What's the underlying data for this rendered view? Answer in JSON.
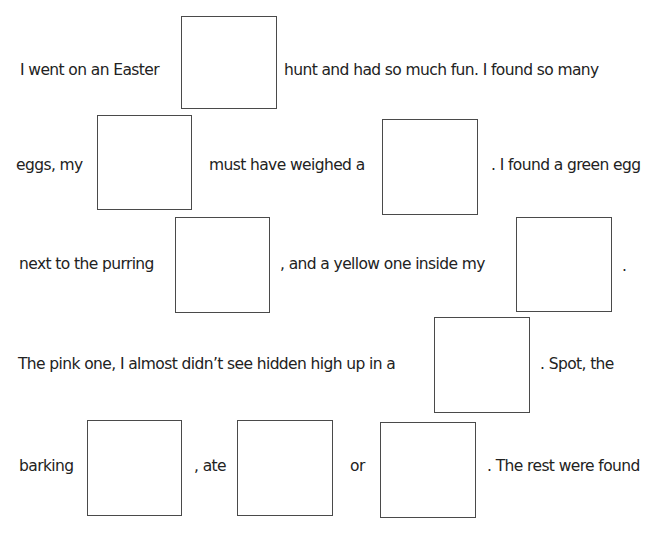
{
  "worksheet": {
    "lines": [
      {
        "segments": [
          {
            "text": "I went on an Easter",
            "x": 20,
            "y": 70
          },
          {
            "text": "hunt and had so much fun. I found so many",
            "x": 284,
            "y": 70
          }
        ],
        "blanks": [
          {
            "x": 181,
            "y": 16,
            "w": 96,
            "h": 93
          }
        ]
      },
      {
        "segments": [
          {
            "text": "eggs, my",
            "x": 16,
            "y": 165
          },
          {
            "text": "must have weighed a",
            "x": 209,
            "y": 165
          },
          {
            "text": ". I found a green egg",
            "x": 491,
            "y": 165
          }
        ],
        "blanks": [
          {
            "x": 97,
            "y": 115,
            "w": 95,
            "h": 95
          },
          {
            "x": 382,
            "y": 119,
            "w": 96,
            "h": 96
          }
        ]
      },
      {
        "segments": [
          {
            "text": "next to the purring",
            "x": 19,
            "y": 264
          },
          {
            "text": ", and a yellow one inside my",
            "x": 280,
            "y": 264
          },
          {
            "text": ".",
            "x": 622,
            "y": 268
          }
        ],
        "blanks": [
          {
            "x": 175,
            "y": 217,
            "w": 95,
            "h": 96
          },
          {
            "x": 516,
            "y": 217,
            "w": 96,
            "h": 95
          }
        ]
      },
      {
        "segments": [
          {
            "text": "The pink one, I almost didn’t see hidden high up in a",
            "x": 18,
            "y": 364
          },
          {
            "text": ". Spot, the",
            "x": 540,
            "y": 364
          }
        ],
        "blanks": [
          {
            "x": 434,
            "y": 317,
            "w": 96,
            "h": 96
          }
        ]
      },
      {
        "segments": [
          {
            "text": "barking",
            "x": 19,
            "y": 466
          },
          {
            "text": ", ate",
            "x": 194,
            "y": 466
          },
          {
            "text": "or",
            "x": 350,
            "y": 466
          },
          {
            "text": ". The rest were found",
            "x": 487,
            "y": 466
          }
        ],
        "blanks": [
          {
            "x": 87,
            "y": 420,
            "w": 95,
            "h": 96
          },
          {
            "x": 237,
            "y": 420,
            "w": 96,
            "h": 96
          },
          {
            "x": 380,
            "y": 422,
            "w": 96,
            "h": 96
          }
        ]
      }
    ]
  }
}
